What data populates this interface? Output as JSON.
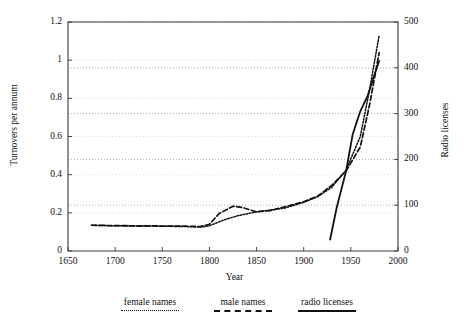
{
  "chart_data": {
    "type": "line",
    "title": "",
    "xlabel": "Year",
    "ylabel": "Turnovers per annum",
    "ylabel_right": "Radio licenses",
    "xlim": [
      1650,
      2000
    ],
    "ylim": [
      0,
      1.2
    ],
    "ylim_right": [
      0,
      500
    ],
    "xticks": [
      1650,
      1700,
      1750,
      1800,
      1850,
      1900,
      1950,
      2000
    ],
    "yticks": [
      0,
      0.2,
      0.4,
      0.6,
      0.8,
      1,
      1.2
    ],
    "yticks_right": [
      0,
      100,
      200,
      300,
      400,
      500
    ],
    "grid": "horizontal-dotted-right-axis",
    "legend_position": "below-axes",
    "series": [
      {
        "name": "female names",
        "style": "dotted",
        "axis": "left",
        "x": [
          1675,
          1700,
          1725,
          1750,
          1775,
          1790,
          1800,
          1815,
          1830,
          1850,
          1865,
          1880,
          1900,
          1915,
          1930,
          1945,
          1960,
          1970,
          1980
        ],
        "y": [
          0.135,
          0.132,
          0.131,
          0.13,
          0.128,
          0.125,
          0.132,
          0.162,
          0.185,
          0.205,
          0.215,
          0.225,
          0.255,
          0.285,
          0.335,
          0.425,
          0.6,
          0.85,
          1.13
        ]
      },
      {
        "name": "male names",
        "style": "dashed",
        "axis": "left",
        "x": [
          1675,
          1700,
          1725,
          1750,
          1775,
          1790,
          1800,
          1810,
          1825,
          1835,
          1850,
          1865,
          1880,
          1900,
          1915,
          1930,
          1945,
          1960,
          1970,
          1980
        ],
        "y": [
          0.135,
          0.133,
          0.132,
          0.131,
          0.13,
          0.128,
          0.14,
          0.195,
          0.235,
          0.228,
          0.205,
          0.212,
          0.232,
          0.258,
          0.288,
          0.345,
          0.42,
          0.545,
          0.77,
          1.04
        ]
      },
      {
        "name": "radio licenses",
        "style": "solid",
        "axis": "right",
        "x": [
          1928,
          1935,
          1945,
          1952,
          1960,
          1968,
          1975,
          1980
        ],
        "y": [
          25,
          95,
          175,
          255,
          305,
          340,
          385,
          415
        ]
      }
    ]
  },
  "legend": {
    "items": [
      {
        "label": "female names",
        "style": "dotted"
      },
      {
        "label": "male names",
        "style": "dashed"
      },
      {
        "label": "radio licenses",
        "style": "solid"
      }
    ]
  },
  "axes": {
    "x_tick_labels": [
      "1650",
      "1700",
      "1750",
      "1800",
      "1850",
      "1900",
      "1950",
      "2000"
    ],
    "y_tick_labels": [
      "0",
      "0.2",
      "0.4",
      "0.6",
      "0.8",
      "1",
      "1.2"
    ],
    "y_right_tick_labels": [
      "0",
      "100",
      "200",
      "300",
      "400",
      "500"
    ]
  }
}
